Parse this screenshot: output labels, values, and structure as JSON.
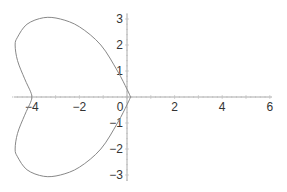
{
  "chart_data": {
    "type": "line",
    "title": "",
    "xlabel": "",
    "ylabel": "",
    "xlim": [
      -4.9,
      6.2
    ],
    "ylim": [
      -3.2,
      3.3
    ],
    "grid": false,
    "legend": null,
    "x_ticks": [
      -4,
      -2,
      0,
      2,
      4,
      6
    ],
    "x_tick_labels": [
      "−4",
      "−2",
      "0",
      "2",
      "4",
      "6"
    ],
    "y_ticks": [
      -3,
      -2,
      -1,
      1,
      2,
      3
    ],
    "y_tick_labels": [
      "−3",
      "−2",
      "−1",
      "1",
      "2",
      "3"
    ],
    "series": [
      {
        "name": "curve",
        "color": "#888888",
        "points": [
          [
            0.15,
            0
          ],
          [
            0.0,
            0.3
          ],
          [
            -0.4,
            1.0
          ],
          [
            -1.1,
            2.0
          ],
          [
            -2.0,
            2.7
          ],
          [
            -2.8,
            3.0
          ],
          [
            -3.5,
            3.05
          ],
          [
            -4.2,
            2.8
          ],
          [
            -4.6,
            2.3
          ],
          [
            -4.7,
            2.0
          ],
          [
            -4.6,
            1.4
          ],
          [
            -4.3,
            0.7
          ],
          [
            -4.05,
            0.2
          ],
          [
            -4.0,
            0
          ],
          [
            -4.05,
            -0.2
          ],
          [
            -4.3,
            -0.7
          ],
          [
            -4.6,
            -1.4
          ],
          [
            -4.7,
            -2.0
          ],
          [
            -4.6,
            -2.3
          ],
          [
            -4.2,
            -2.8
          ],
          [
            -3.5,
            -3.05
          ],
          [
            -2.8,
            -3.0
          ],
          [
            -2.0,
            -2.7
          ],
          [
            -1.1,
            -2.0
          ],
          [
            -0.4,
            -1.0
          ],
          [
            0.0,
            -0.3
          ],
          [
            0.15,
            0
          ]
        ]
      }
    ]
  }
}
